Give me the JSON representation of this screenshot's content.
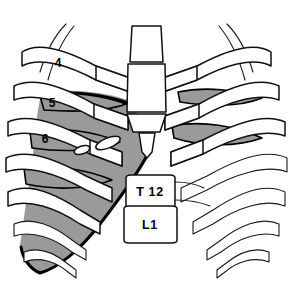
{
  "figure": {
    "background_color": "#ffffff",
    "line_color": "#111111",
    "shade_color": "#9a9a9a",
    "bone_color": "#ffffff"
  },
  "labels": {
    "ribs": [
      {
        "id": "rib-4",
        "text": "4",
        "x": 58,
        "y": 67
      },
      {
        "id": "rib-5",
        "text": "5",
        "x": 52,
        "y": 107
      },
      {
        "id": "rib-6",
        "text": "6",
        "x": 45,
        "y": 143
      }
    ],
    "vertebrae": [
      {
        "id": "vertebra-t12",
        "text": "T 12",
        "x": 150,
        "y": 194
      },
      {
        "id": "vertebra-l1",
        "text": "L1",
        "x": 150,
        "y": 225
      }
    ]
  },
  "structures": {
    "sternum": "sternum",
    "manubrium": "manubrium",
    "xiphoid": "xiphoid-process",
    "diaphragm_shading": "diaphragm-shaded-region",
    "intercostal_shading": "intercostal-spaces",
    "costal_margin": "costal-margin"
  }
}
